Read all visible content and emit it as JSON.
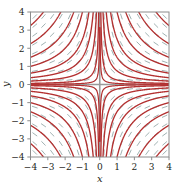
{
  "figure": {
    "background": "#ffffff",
    "frame_color": "#8c8c8c",
    "axis_color": "#9a9a9a"
  },
  "chart_data": {
    "type": "line",
    "title": "",
    "subtitle": "",
    "xlabel": "x",
    "ylabel": "y",
    "xlim": [
      -4,
      4
    ],
    "ylim": [
      -4,
      4
    ],
    "grid": false,
    "legend": "none",
    "annotations": [],
    "equation": "dy/dx = -y/x",
    "solution_family": "y = c/x",
    "curve_color": "#b33030",
    "slope_field": {
      "color": "#8aa0a0",
      "style": "dashed-segments",
      "slope_rule": "-y/x",
      "grid_step": 0.5,
      "segment_length": 0.34
    },
    "xticks": [
      -4,
      -3,
      -2,
      -1,
      0,
      1,
      2,
      3,
      4
    ],
    "yticks": [
      4,
      3,
      2,
      1,
      0,
      -1,
      -2,
      -3,
      -4
    ],
    "xtick_labels": [
      "−4",
      "−3",
      "−2",
      "−1",
      "0",
      "1",
      "2",
      "3",
      "4"
    ],
    "ytick_labels": [
      "4",
      "3",
      "2",
      "1",
      "0",
      "−1",
      "−2",
      "−3",
      "−4"
    ],
    "series": [
      {
        "name": "c = 0.25",
        "c": 0.25
      },
      {
        "name": "c = 0.75",
        "c": 0.75
      },
      {
        "name": "c = 1.5",
        "c": 1.5
      },
      {
        "name": "c = 2.5",
        "c": 2.5
      },
      {
        "name": "c = 4",
        "c": 4
      },
      {
        "name": "c = 6",
        "c": 6
      },
      {
        "name": "c = 9",
        "c": 9
      },
      {
        "name": "c = 13",
        "c": 13
      },
      {
        "name": "c = -0.25",
        "c": -0.25
      },
      {
        "name": "c = -0.75",
        "c": -0.75
      },
      {
        "name": "c = -1.5",
        "c": -1.5
      },
      {
        "name": "c = -2.5",
        "c": -2.5
      },
      {
        "name": "c = -4",
        "c": -4
      },
      {
        "name": "c = -6",
        "c": -6
      },
      {
        "name": "c = -9",
        "c": -9
      },
      {
        "name": "c = -13",
        "c": -13
      }
    ]
  }
}
